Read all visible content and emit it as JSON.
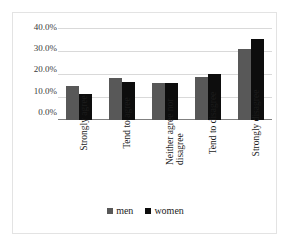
{
  "chart_data": {
    "type": "bar",
    "title": "",
    "subtitle": "",
    "xlabel": "",
    "ylabel": "",
    "categories": [
      "Strongly agree",
      "Tend to agree",
      "Neither agree nor disagree",
      "Tend to disagree",
      "Strongly disagree"
    ],
    "series": [
      {
        "name": "men",
        "color": "#585858",
        "values": [
          14.7,
          18.3,
          16.1,
          18.5,
          30.8
        ]
      },
      {
        "name": "women",
        "color": "#0d0d0d",
        "values": [
          11.2,
          16.4,
          16.1,
          19.9,
          35.1
        ]
      }
    ],
    "ylim": [
      0,
      40
    ],
    "ytick_values": [
      0,
      10,
      20,
      30,
      40
    ],
    "ytick_labels": [
      "0.0%",
      "10.0%",
      "20.0%",
      "30.0%",
      "40.0%"
    ],
    "grid": true,
    "grid_axis": "y",
    "legend_position": "bottom",
    "legend_entries": [
      "men",
      "women"
    ],
    "value_format": "percent"
  },
  "axis": {
    "y_labels": [
      "40.0%",
      "30.0%",
      "20.0%",
      "10.0%",
      "0.0%"
    ]
  },
  "legend": {
    "items": [
      {
        "label": "men"
      },
      {
        "label": "women"
      }
    ]
  }
}
